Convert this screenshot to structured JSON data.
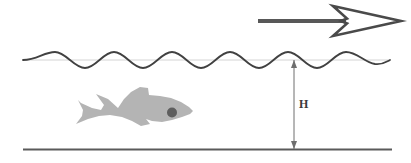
{
  "diagram": {
    "canvas": {
      "width": 411,
      "height": 163,
      "background": "#ffffff"
    },
    "labels": {
      "depth": "H"
    },
    "colors": {
      "wave_line": "#414141",
      "mean_level_line": "#cfcfcf",
      "seabed_line": "#5a5a5a",
      "arrow_fill": "#585858",
      "arrow_outline": "#4a4a4a",
      "fish_body": "#b4b4b4",
      "fish_eye": "#5e5e5e",
      "dimension_line": "#6e6e6e",
      "label_text": "#3a3a3a"
    },
    "elements": {
      "wave": {
        "name": "water-surface-wave",
        "x_start": 23,
        "x_end": 390,
        "mean_level_y": 60,
        "amplitude": 8,
        "wavelength": 117,
        "stroke_width": 1.8,
        "phase_peaks_x": [
          55,
          172,
          289
        ],
        "phase_troughs_x": [
          114,
          231,
          348
        ]
      },
      "mean_level": {
        "name": "still-water-level-line",
        "x_start": 23,
        "x_end": 390,
        "y": 60,
        "stroke_width": 0.8
      },
      "seabed": {
        "name": "seabed-line",
        "x_start": 23,
        "x_end": 392,
        "y": 149,
        "stroke_width": 2
      },
      "direction_arrow": {
        "name": "wave-direction-arrow",
        "tail_x": 258,
        "tip_x": 401,
        "y": 21,
        "shaft_thickness": 4,
        "head_style": "hollow-swept-barb",
        "points_to": "right"
      },
      "depth_dimension": {
        "name": "wave-height-dimension",
        "x": 294,
        "y_top": 60,
        "y_bottom": 149,
        "value_label": "H",
        "label_x": 300,
        "label_y": 104,
        "arrowheads": "both-ends"
      },
      "fish": {
        "name": "fish-silhouette",
        "facing": "right",
        "bbox": {
          "x": 75,
          "y": 87,
          "width": 118,
          "height": 46
        },
        "eye": {
          "cx": 172,
          "cy": 113,
          "r": 5
        }
      }
    }
  }
}
